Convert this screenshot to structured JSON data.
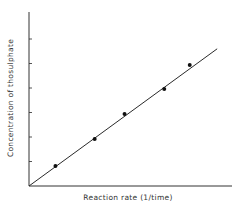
{
  "chart_data": {
    "type": "scatter",
    "title": "",
    "xlabel": "Reaction rate (1/time)",
    "ylabel": "Concentration of thosulphate",
    "grid": false,
    "legend": null,
    "xlim": [
      0,
      8
    ],
    "ylim": [
      0,
      7
    ],
    "y_ticks": [
      1,
      2,
      3,
      4,
      5,
      6
    ],
    "x_ticks": [],
    "series": [
      {
        "name": "measurements",
        "x": [
          1.08,
          2.68,
          3.9,
          5.52,
          6.56
        ],
        "y": [
          0.82,
          1.92,
          2.94,
          3.96,
          4.94
        ]
      }
    ],
    "fit_line": {
      "x": [
        0,
        7.68
      ],
      "y": [
        0,
        5.6
      ],
      "type": "linear through origin"
    }
  },
  "colors": {
    "ink": "#2a2a2a",
    "background": "#ffffff"
  }
}
